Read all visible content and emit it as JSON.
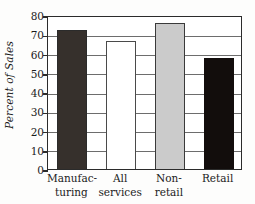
{
  "chart_data": {
    "type": "bar",
    "title": "",
    "subtitle": "",
    "xlabel": "",
    "ylabel": "Percent of Sales",
    "ylim": [
      0,
      80
    ],
    "ytick_values": [
      0,
      10,
      20,
      30,
      40,
      50,
      60,
      70,
      80
    ],
    "ytick_labels": [
      "0",
      "10",
      "20",
      "30",
      "40",
      "50",
      "60",
      "70",
      "80"
    ],
    "grid": "horizontal",
    "legend": "none",
    "categories": [
      "Manufacturing",
      "All services",
      "Non-retail",
      "Retail"
    ],
    "category_label_lines": [
      [
        "Manufac-",
        "turing"
      ],
      [
        "All",
        "services"
      ],
      [
        "Non-",
        "retail"
      ],
      [
        "Retail"
      ]
    ],
    "values": [
      72,
      66.5,
      76,
      57.5
    ],
    "bar_styles": [
      {
        "fill": "#36302c",
        "stroke": "#2b2b2b"
      },
      {
        "fill": "#ffffff",
        "stroke": "#4a4a4a"
      },
      {
        "fill": "#cbcbcb",
        "stroke": "#3a3a3a"
      },
      {
        "fill": "#120d0c",
        "stroke": "#120d0c"
      }
    ]
  },
  "colors": {
    "frame": "#2b2b2b",
    "gridline": "#6d6d6d",
    "text": "#1b1b1b",
    "background": "#fdfdfc"
  }
}
